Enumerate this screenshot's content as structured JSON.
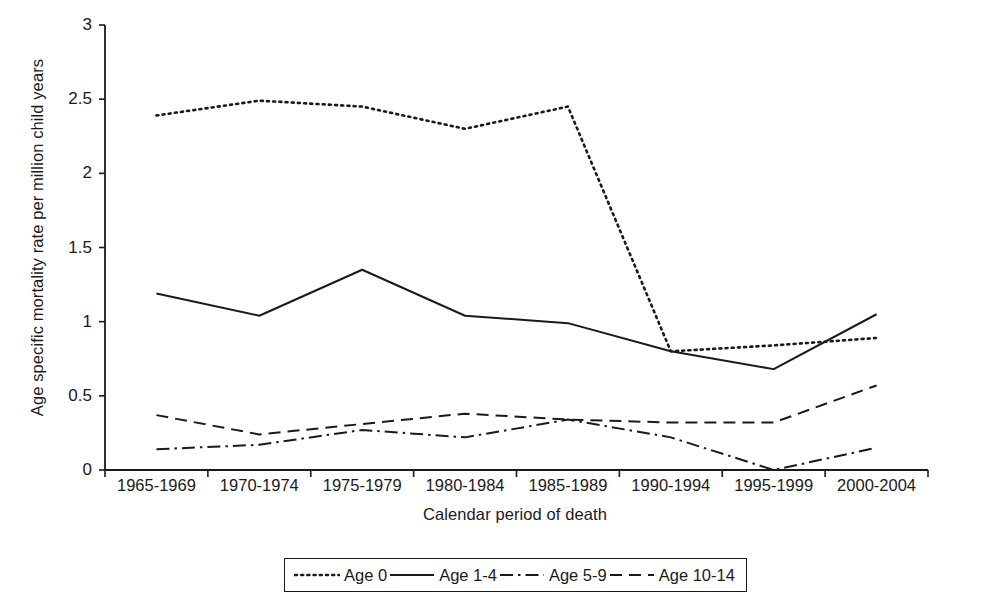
{
  "chart_data": {
    "type": "line",
    "title": "",
    "xlabel": "Calendar period of death",
    "ylabel": "Age specific mortality rate per million child years",
    "categories": [
      "1965-1969",
      "1970-1974",
      "1975-1979",
      "1980-1984",
      "1985-1989",
      "1990-1994",
      "1995-1999",
      "2000-2004"
    ],
    "ylim": [
      0,
      3
    ],
    "yticks": [
      "0",
      "0.5",
      "1",
      "1.5",
      "2",
      "2.5",
      "3"
    ],
    "ytick_values": [
      0,
      0.5,
      1,
      1.5,
      2,
      2.5,
      3
    ],
    "grid": false,
    "legend_position": "bottom",
    "series": [
      {
        "name": "Age 0",
        "style": "dotted",
        "color": "#1a1a1a",
        "values": [
          2.39,
          2.49,
          2.45,
          2.3,
          2.45,
          0.8,
          0.84,
          0.89
        ]
      },
      {
        "name": "Age 1-4",
        "style": "solid",
        "color": "#1a1a1a",
        "values": [
          1.19,
          1.04,
          1.35,
          1.04,
          0.99,
          0.8,
          0.68,
          1.05
        ]
      },
      {
        "name": "Age 5-9",
        "style": "dashdot",
        "color": "#1a1a1a",
        "values": [
          0.14,
          0.17,
          0.27,
          0.22,
          0.34,
          0.22,
          0.0,
          0.15
        ]
      },
      {
        "name": "Age 10-14",
        "style": "dashed",
        "color": "#1a1a1a",
        "values": [
          0.37,
          0.24,
          0.31,
          0.38,
          0.34,
          0.32,
          0.32,
          0.57
        ]
      }
    ]
  },
  "axis": {
    "line_color": "#1a1a1a"
  }
}
